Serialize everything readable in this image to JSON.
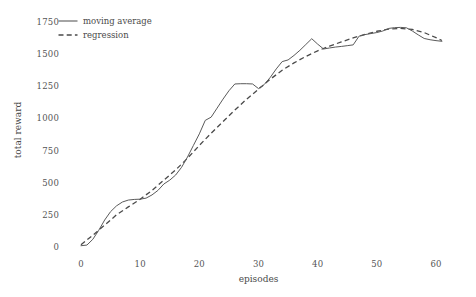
{
  "chart_data": {
    "type": "line",
    "title": "",
    "subtitle": "",
    "xlabel": "episodes",
    "ylabel": "total reward",
    "xlim": [
      -1.5,
      62.5
    ],
    "ylim": [
      -60,
      1790
    ],
    "xticks": [
      0,
      10,
      20,
      30,
      40,
      50,
      60
    ],
    "xtick_labels": [
      "0",
      "10",
      "20",
      "30",
      "40",
      "50",
      "60"
    ],
    "yticks": [
      0,
      250,
      500,
      750,
      1000,
      1250,
      1500,
      1750
    ],
    "ytick_labels": [
      "0",
      "250",
      "500",
      "750",
      "1000",
      "1250",
      "1500",
      "1750"
    ],
    "grid": false,
    "legend_position": "upper left",
    "legend_entries": [
      "moving average",
      "regression"
    ],
    "series": [
      {
        "name": "moving average",
        "style": "solid",
        "color": "#5a5a5a",
        "linewidth": 1.0,
        "x": [
          0,
          1,
          2,
          3,
          4,
          5,
          6,
          7,
          8,
          9,
          10,
          11,
          12,
          13,
          14,
          15,
          16,
          17,
          18,
          19,
          20,
          21,
          22,
          23,
          24,
          25,
          26,
          27,
          28,
          29,
          30,
          31,
          32,
          33,
          34,
          35,
          36,
          37,
          38,
          39,
          40,
          41,
          42,
          43,
          44,
          45,
          46,
          47,
          48,
          49,
          50,
          51,
          52,
          53,
          54,
          55,
          56,
          57,
          58,
          59,
          60,
          61
        ],
        "values": [
          10,
          15,
          60,
          130,
          210,
          275,
          320,
          350,
          365,
          370,
          372,
          380,
          405,
          440,
          490,
          520,
          560,
          620,
          700,
          790,
          880,
          985,
          1010,
          1080,
          1150,
          1215,
          1268,
          1270,
          1270,
          1268,
          1232,
          1265,
          1320,
          1385,
          1442,
          1455,
          1490,
          1530,
          1575,
          1620,
          1578,
          1540,
          1548,
          1555,
          1560,
          1566,
          1572,
          1640,
          1652,
          1660,
          1668,
          1680,
          1700,
          1706,
          1708,
          1705,
          1680,
          1650,
          1622,
          1612,
          1605,
          1600
        ]
      },
      {
        "name": "regression",
        "style": "dashed",
        "color": "#4a4a4a",
        "linewidth": 1.2,
        "x": [
          0,
          2,
          4,
          6,
          8,
          10,
          12,
          14,
          16,
          18,
          20,
          22,
          24,
          26,
          28,
          30,
          32,
          34,
          36,
          38,
          40,
          42,
          44,
          46,
          48,
          50,
          52,
          54,
          56,
          58,
          60,
          61
        ],
        "values": [
          18,
          92,
          170,
          250,
          312,
          372,
          440,
          520,
          600,
          690,
          790,
          885,
          975,
          1065,
          1150,
          1228,
          1305,
          1375,
          1432,
          1482,
          1526,
          1562,
          1595,
          1626,
          1654,
          1678,
          1694,
          1700,
          1692,
          1668,
          1628,
          1606
        ]
      }
    ]
  },
  "axes": {
    "ylabel_text": "total reward",
    "xlabel_text": "episodes"
  },
  "legend": {
    "items": [
      {
        "label": "moving average",
        "style": "solid"
      },
      {
        "label": "regression",
        "style": "dashed"
      }
    ]
  },
  "colors": {
    "background": "#ffffff",
    "moving_average": "#5a5a5a",
    "regression": "#4a4a4a",
    "text": "#4a4a4a"
  }
}
